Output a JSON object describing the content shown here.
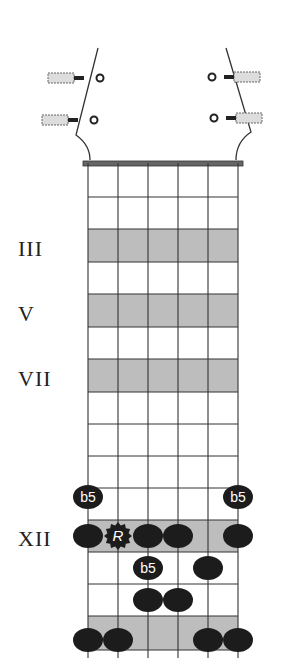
{
  "diagram": {
    "title": "",
    "strings": 6,
    "string_x": [
      88,
      118,
      148,
      178,
      208,
      238
    ],
    "nut_y": 163,
    "fret_y": [
      165,
      197,
      229,
      262,
      294,
      327,
      359,
      392,
      424,
      456,
      488,
      520,
      552,
      584,
      616,
      650
    ],
    "shaded_frets": [
      3,
      5,
      7,
      12,
      15
    ],
    "colors": {
      "line": "#333333",
      "shade": "#bdbdbd",
      "dot": "#1c1c1c",
      "dot_text": "#ffffff"
    },
    "fret_markers": [
      {
        "label": "III",
        "fret": 3
      },
      {
        "label": "V",
        "fret": 5
      },
      {
        "label": "VII",
        "fret": 7
      },
      {
        "label": "XII",
        "fret": 12
      }
    ],
    "notes": [
      {
        "string": 1,
        "fret": 11,
        "label": "b5"
      },
      {
        "string": 6,
        "fret": 11,
        "label": "b5"
      },
      {
        "string": 1,
        "fret": 12,
        "label": ""
      },
      {
        "string": 2,
        "fret": 12,
        "label": "R",
        "root": true
      },
      {
        "string": 3,
        "fret": 12,
        "label": ""
      },
      {
        "string": 4,
        "fret": 12,
        "label": ""
      },
      {
        "string": 6,
        "fret": 12,
        "label": ""
      },
      {
        "string": 3,
        "fret": 13,
        "label": "b5"
      },
      {
        "string": 5,
        "fret": 13,
        "label": ""
      },
      {
        "string": 3,
        "fret": 14,
        "label": ""
      },
      {
        "string": 4,
        "fret": 14,
        "label": ""
      },
      {
        "string": 1,
        "fret": 15,
        "label": ""
      },
      {
        "string": 2,
        "fret": 15,
        "label": ""
      },
      {
        "string": 5,
        "fret": 15,
        "label": ""
      },
      {
        "string": 6,
        "fret": 15,
        "label": ""
      }
    ]
  }
}
